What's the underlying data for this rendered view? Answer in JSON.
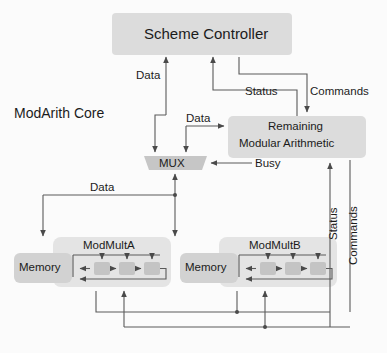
{
  "diagram": {
    "core_label": "ModArith Core",
    "background_color": "#fbfbfb",
    "block_fill": "#d8d8d8",
    "block_fill_light": "#e3e3e3",
    "line_color": "#5a5a5a",
    "text_color": "#1b1b1b"
  },
  "blocks": {
    "scheme_controller": {
      "label": "Scheme Controller"
    },
    "remaining": {
      "label_line1": "Remaining",
      "label_line2": "Modular Arithmetic"
    },
    "mux": {
      "label": "MUX"
    },
    "modmult_a": {
      "label": "ModMultA",
      "memory_label": "Memory"
    },
    "modmult_b": {
      "label": "ModMultB",
      "memory_label": "Memory"
    }
  },
  "edge_labels": {
    "data_to_controller": "Data",
    "data_to_remaining": "Data",
    "status": "Status",
    "commands": "Commands",
    "busy": "Busy",
    "data_bus": "Data",
    "status_vertical": "Status",
    "commands_vertical": "Commands"
  }
}
